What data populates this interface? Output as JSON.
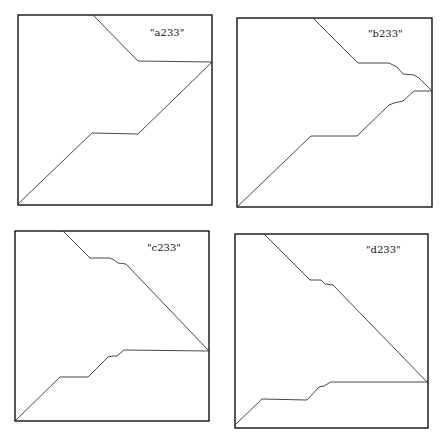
{
  "chart_data": [
    {
      "type": "line",
      "title": "\"a233\"",
      "box": [
        18,
        15,
        212,
        205
      ],
      "label_pos": [
        150,
        36
      ],
      "series": [
        {
          "name": "upper",
          "points": [
            [
              93,
              15
            ],
            [
              138,
              61
            ],
            [
              212,
              62
            ]
          ]
        },
        {
          "name": "lower",
          "points": [
            [
              18,
              204
            ],
            [
              92,
              133
            ],
            [
              138,
              134
            ],
            [
              212,
              62
            ]
          ]
        }
      ]
    },
    {
      "type": "line",
      "title": "\"b233\"",
      "box": [
        237,
        18,
        432,
        207
      ],
      "label_pos": [
        368,
        37
      ],
      "series": [
        {
          "name": "upper",
          "points": [
            [
              313,
              18
            ],
            [
              358,
              63
            ],
            [
              389,
              63
            ],
            [
              397,
              67
            ],
            [
              403,
              74
            ],
            [
              414,
              75
            ],
            [
              419,
              78
            ],
            [
              432,
              91
            ]
          ]
        },
        {
          "name": "lower",
          "points": [
            [
              237,
              207
            ],
            [
              311,
              136
            ],
            [
              357,
              136
            ],
            [
              389,
              105
            ],
            [
              394,
              103
            ],
            [
              403,
              101
            ],
            [
              414,
              91
            ],
            [
              432,
              91
            ]
          ]
        }
      ]
    },
    {
      "type": "line",
      "title": "\"c233\"",
      "box": [
        15,
        231,
        209,
        421
      ],
      "label_pos": [
        147,
        251
      ],
      "series": [
        {
          "name": "upper",
          "points": [
            [
              63,
              231
            ],
            [
              90,
              258
            ],
            [
              110,
              258
            ],
            [
              114,
              260
            ],
            [
              118,
              263
            ],
            [
              126,
              264
            ],
            [
              209,
              351
            ]
          ]
        },
        {
          "name": "lower",
          "points": [
            [
              15,
              421
            ],
            [
              60,
              377
            ],
            [
              88,
              377
            ],
            [
              108,
              357
            ],
            [
              113,
              356
            ],
            [
              117,
              356
            ],
            [
              124,
              350
            ],
            [
              209,
              351
            ]
          ]
        }
      ]
    },
    {
      "type": "line",
      "title": "\"d233\"",
      "box": [
        235,
        234,
        428,
        428
      ],
      "label_pos": [
        366,
        253
      ],
      "series": [
        {
          "name": "upper",
          "points": [
            [
              264,
              234
            ],
            [
              310,
              280
            ],
            [
              321,
              280
            ],
            [
              325,
              284
            ],
            [
              333,
              285
            ],
            [
              428,
              383
            ]
          ]
        },
        {
          "name": "lower",
          "points": [
            [
              235,
              425
            ],
            [
              262,
              399
            ],
            [
              307,
              400
            ],
            [
              319,
              387
            ],
            [
              324,
              386
            ],
            [
              329,
              383
            ],
            [
              331,
              382
            ],
            [
              428,
              382
            ]
          ]
        }
      ]
    }
  ],
  "labels": {
    "a": "\"a233\"",
    "b": "\"b233\"",
    "c": "\"c233\"",
    "d": "\"d233\""
  }
}
